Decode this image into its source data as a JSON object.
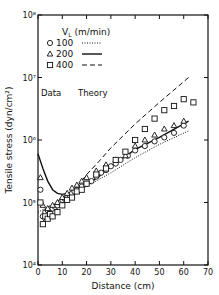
{
  "chart_data": {
    "type": "scatter",
    "title": "",
    "xlabel": "Distance (cm)",
    "ylabel": "Tensile stress (dyn/cm²)",
    "xlim": [
      0,
      70
    ],
    "ylim": [
      10000,
      100000000
    ],
    "yscale": "log",
    "x_ticks": [
      "0",
      "10",
      "20",
      "30",
      "40",
      "50",
      "60",
      "70"
    ],
    "y_ticks": [
      "10⁴",
      "10⁵",
      "10⁶",
      "10⁷",
      "10⁸"
    ],
    "legend": {
      "header": "V_L (m/min)",
      "subscript": "L",
      "col_data": "Data",
      "col_theory": "Theory",
      "entries": [
        {
          "value": "100",
          "marker": "circle",
          "line": "dotted"
        },
        {
          "value": "200",
          "marker": "triangle",
          "line": "solid"
        },
        {
          "value": "400",
          "marker": "square",
          "line": "dashed"
        }
      ]
    },
    "series": [
      {
        "name": "100 data",
        "marker": "circle",
        "x": [
          1,
          2,
          3,
          4,
          5,
          6,
          7,
          8,
          9,
          10,
          11,
          12,
          13,
          14,
          15,
          16,
          18,
          20,
          22,
          24,
          26,
          28,
          30,
          32,
          34,
          37,
          40,
          44,
          48,
          52,
          56,
          60
        ],
        "y": [
          160000,
          60000,
          70000,
          75000,
          80000,
          80000,
          85000,
          90000,
          100000,
          110000,
          115000,
          120000,
          130000,
          140000,
          150000,
          160000,
          180000,
          200000,
          220000,
          260000,
          300000,
          330000,
          380000,
          420000,
          480000,
          560000,
          680000,
          800000,
          950000,
          1100000,
          1300000,
          1700000
        ]
      },
      {
        "name": "200 data",
        "marker": "triangle",
        "x": [
          1,
          2,
          4,
          6,
          8,
          10,
          12,
          14,
          16,
          18,
          20,
          24,
          28,
          32,
          36,
          40,
          44,
          48,
          52,
          56,
          60
        ],
        "y": [
          250000,
          90000,
          80000,
          90000,
          100000,
          120000,
          140000,
          170000,
          190000,
          220000,
          250000,
          320000,
          400000,
          480000,
          560000,
          800000,
          1000000,
          1200000,
          1500000,
          1700000,
          2000000
        ]
      },
      {
        "name": "400 data",
        "marker": "square",
        "x": [
          1,
          2,
          3,
          4,
          5,
          6,
          8,
          10,
          12,
          14,
          16,
          18,
          20,
          24,
          28,
          32,
          36,
          40,
          44,
          48,
          52,
          56,
          60,
          64
        ],
        "y": [
          100000,
          45000,
          60000,
          55000,
          65000,
          60000,
          70000,
          90000,
          110000,
          120000,
          150000,
          160000,
          200000,
          280000,
          350000,
          480000,
          650000,
          1000000,
          1500000,
          2200000,
          3000000,
          3500000,
          4500000,
          4000000
        ]
      },
      {
        "name": "100 theory",
        "line": "dotted",
        "x": [
          0,
          10,
          20,
          30,
          40,
          50,
          62
        ],
        "y": [
          70000,
          110000,
          180000,
          300000,
          520000,
          850000,
          1400000
        ]
      },
      {
        "name": "200 theory",
        "line": "solid",
        "x": [
          0,
          2,
          4,
          6,
          8,
          10,
          12,
          15,
          20,
          25,
          30,
          40,
          50,
          62
        ],
        "y": [
          600000,
          350000,
          220000,
          160000,
          140000,
          135000,
          140000,
          150000,
          190000,
          260000,
          380000,
          700000,
          1100000,
          2000000
        ]
      },
      {
        "name": "400 theory",
        "line": "dashed",
        "x": [
          2,
          5,
          10,
          15,
          20,
          25,
          30,
          40,
          50,
          62
        ],
        "y": [
          50000,
          65000,
          100000,
          160000,
          280000,
          450000,
          750000,
          1800000,
          4000000,
          10000000
        ]
      }
    ]
  }
}
